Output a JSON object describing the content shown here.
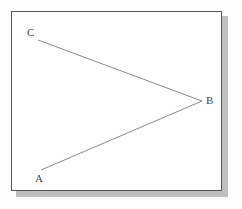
{
  "figure": {
    "name": "angle-abc-diagram",
    "background_color": "#fdfdfd",
    "panel": {
      "fill_color": "#ffffff",
      "border_color": "#555555",
      "shadow_color": "#b4b4b4",
      "x": 11,
      "y": 11,
      "width": 211,
      "height": 180
    },
    "line_color": "#8a8a8a",
    "line_width": 1,
    "label_color": "#4a4a4a",
    "points": [
      {
        "id": "A",
        "label": "A",
        "x": 41,
        "y": 170,
        "label_x": 35,
        "label_y": 173
      },
      {
        "id": "B",
        "label": "B",
        "x": 202,
        "y": 101,
        "label_x": 206,
        "label_y": 95
      },
      {
        "id": "C",
        "label": "C",
        "x": 38,
        "y": 40,
        "label_x": 27,
        "label_y": 27
      }
    ],
    "segments": [
      {
        "id": "segment-CB",
        "from": "C",
        "to": "B",
        "x1": 38,
        "y1": 40,
        "x2": 202,
        "y2": 101
      },
      {
        "id": "segment-AB",
        "from": "A",
        "to": "B",
        "x1": 41,
        "y1": 170,
        "x2": 202,
        "y2": 101
      }
    ]
  }
}
